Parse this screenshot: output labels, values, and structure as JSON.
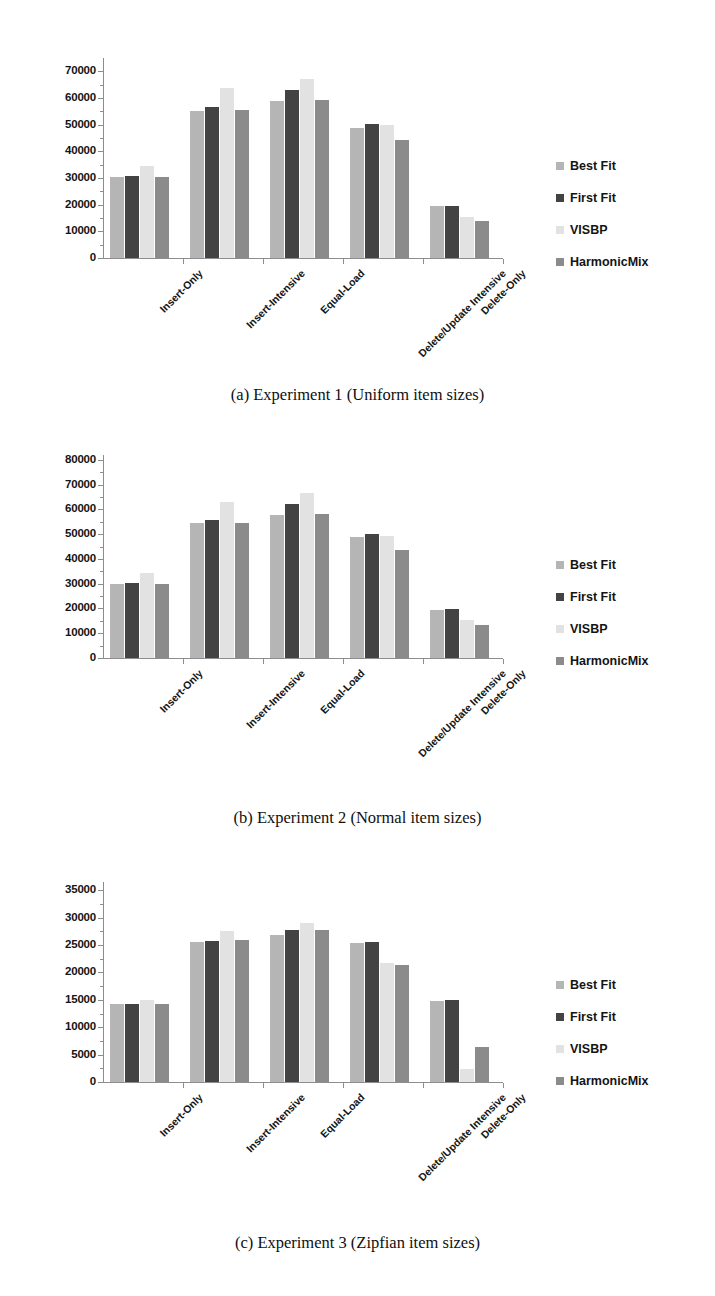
{
  "figure": {
    "palette": {
      "best_fit": "#b5b5b5",
      "first_fit": "#434343",
      "visbp": "#e2e2e2",
      "harmonicmix": "#8b8b8b",
      "axis": "#8d8d8d",
      "text": "#141414",
      "background": "#ffffff"
    },
    "legend_title": "",
    "series_names": [
      "Best Fit",
      "First Fit",
      "VISBP",
      "HarmonicMix"
    ],
    "categories": [
      "Insert-Only",
      "Insert-Intensive",
      "Equal-Load",
      "Delete/Update Intensive",
      "Delete-Only"
    ]
  },
  "panels": [
    {
      "id": "panel-a",
      "caption": "(a)  Experiment 1 (Uniform item sizes)",
      "legend": {
        "items": [
          {
            "label": "Best Fit",
            "color": "#b5b5b5"
          },
          {
            "label": "First Fit",
            "color": "#434343"
          },
          {
            "label": "VISBP",
            "color": "#e2e2e2"
          },
          {
            "label": "HarmonicMix",
            "color": "#8b8b8b"
          }
        ]
      },
      "chart_data": {
        "type": "bar",
        "title": "",
        "xlabel": "",
        "ylabel": "",
        "ylim": [
          0,
          75000
        ],
        "yticks": [
          0,
          10000,
          20000,
          30000,
          40000,
          50000,
          60000,
          70000
        ],
        "ytick_labels": [
          "0",
          "10000",
          "20000",
          "30000",
          "40000",
          "50000",
          "60000",
          "70000"
        ],
        "grid": false,
        "legend_position": "right",
        "categories": [
          "Insert-Only",
          "Insert-Intensive",
          "Equal-Load",
          "Delete/Update Intensive",
          "Delete-Only"
        ],
        "series": [
          {
            "name": "Best Fit",
            "color": "#b5b5b5",
            "values": [
              30300,
              55200,
              58900,
              48900,
              19400
            ]
          },
          {
            "name": "First Fit",
            "color": "#434343",
            "values": [
              30700,
              56800,
              63100,
              50100,
              19600
            ]
          },
          {
            "name": "VISBP",
            "color": "#e2e2e2",
            "values": [
              34500,
              63800,
              67100,
              49900,
              15400
            ]
          },
          {
            "name": "HarmonicMix",
            "color": "#8b8b8b",
            "values": [
              30500,
              55600,
              59100,
              44200,
              13800
            ]
          }
        ]
      }
    },
    {
      "id": "panel-b",
      "caption": "(b)  Experiment 2 (Normal item sizes)",
      "legend": {
        "items": [
          {
            "label": "Best Fit",
            "color": "#b5b5b5"
          },
          {
            "label": "First Fit",
            "color": "#434343"
          },
          {
            "label": "VISBP",
            "color": "#e2e2e2"
          },
          {
            "label": "HarmonicMix",
            "color": "#8b8b8b"
          }
        ]
      },
      "chart_data": {
        "type": "bar",
        "title": "",
        "xlabel": "",
        "ylabel": "",
        "ylim": [
          0,
          82000
        ],
        "yticks": [
          0,
          10000,
          20000,
          30000,
          40000,
          50000,
          60000,
          70000,
          80000
        ],
        "ytick_labels": [
          "0",
          "10000",
          "20000",
          "30000",
          "40000",
          "50000",
          "60000",
          "70000",
          "80000"
        ],
        "grid": false,
        "legend_position": "right",
        "categories": [
          "Insert-Only",
          "Insert-Intensive",
          "Equal-Load",
          "Delete/Update Intensive",
          "Delete-Only"
        ],
        "series": [
          {
            "name": "Best Fit",
            "color": "#b5b5b5",
            "values": [
              29800,
              54700,
              57900,
              48900,
              19200
            ]
          },
          {
            "name": "First Fit",
            "color": "#434343",
            "values": [
              30200,
              55900,
              62300,
              50000,
              19600
            ]
          },
          {
            "name": "VISBP",
            "color": "#e2e2e2",
            "values": [
              34400,
              63200,
              66700,
              49300,
              15300
            ]
          },
          {
            "name": "HarmonicMix",
            "color": "#8b8b8b",
            "values": [
              29900,
              54600,
              58100,
              43500,
              13200
            ]
          }
        ]
      }
    },
    {
      "id": "panel-c",
      "caption": "(c)  Experiment 3 (Zipfian item sizes)",
      "legend": {
        "items": [
          {
            "label": "Best Fit",
            "color": "#b5b5b5"
          },
          {
            "label": "First Fit",
            "color": "#434343"
          },
          {
            "label": "VISBP",
            "color": "#e2e2e2"
          },
          {
            "label": "HarmonicMix",
            "color": "#8b8b8b"
          }
        ]
      },
      "chart_data": {
        "type": "bar",
        "title": "",
        "xlabel": "",
        "ylabel": "",
        "ylim": [
          0,
          36500
        ],
        "yticks": [
          0,
          5000,
          10000,
          15000,
          20000,
          25000,
          30000,
          35000
        ],
        "ytick_labels": [
          "0",
          "5000",
          "10000",
          "15000",
          "20000",
          "25000",
          "30000",
          "35000"
        ],
        "grid": false,
        "legend_position": "right",
        "categories": [
          "Insert-Only",
          "Insert-Intensive",
          "Equal-Load",
          "Delete/Update Intensive",
          "Delete-Only"
        ],
        "series": [
          {
            "name": "Best Fit",
            "color": "#b5b5b5",
            "values": [
              14200,
              25600,
              26800,
              25300,
              14800
            ]
          },
          {
            "name": "First Fit",
            "color": "#434343",
            "values": [
              14300,
              25800,
              27700,
              25600,
              14900
            ]
          },
          {
            "name": "VISBP",
            "color": "#e2e2e2",
            "values": [
              14900,
              27500,
              29100,
              21700,
              2300
            ]
          },
          {
            "name": "HarmonicMix",
            "color": "#8b8b8b",
            "values": [
              14200,
              25900,
              27800,
              21300,
              6400
            ]
          }
        ]
      }
    }
  ]
}
